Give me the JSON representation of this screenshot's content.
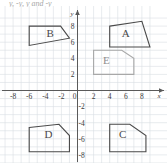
{
  "top_fragment": {
    "text": "y, -y,  y  and  -y"
  },
  "graph": {
    "colors": {
      "grid": "#d9dde3",
      "axis": "#5a5a5a",
      "shape_dark": "#4a4a4a",
      "shape_light": "#a8a8a8",
      "label_dark": "#4a4a4a",
      "label_light": "#8d8d8d",
      "background": "#ffffff"
    },
    "x_axis": {
      "name": "x",
      "min": -9,
      "max": 9,
      "tick_step": 2,
      "tick_labels": [
        "-8",
        "-6",
        "-4",
        "-2",
        "2",
        "4",
        "6",
        "8"
      ],
      "tick_values": [
        -8,
        -6,
        -4,
        -2,
        2,
        4,
        6,
        8
      ]
    },
    "y_axis": {
      "name": "y",
      "min": -8.5,
      "max": 9,
      "tick_step": 2,
      "tick_labels": [
        "8",
        "6",
        "4",
        "2",
        "-2",
        "-4",
        "-6",
        "-8"
      ],
      "tick_values": [
        8,
        6,
        4,
        2,
        -2,
        -4,
        -6,
        -8
      ]
    },
    "origin_label": "0",
    "grid_visible": true
  },
  "chart_data": {
    "type": "scatter",
    "title": "",
    "xlabel": "x",
    "ylabel": "y",
    "xlim": [
      -9,
      9
    ],
    "ylim": [
      -8.5,
      9
    ],
    "grid": true,
    "shapes": [
      {
        "label": "A",
        "color": "#4a4a4a",
        "label_x": 6.0,
        "label_y": 6.6,
        "vertices": [
          [
            4,
            8
          ],
          [
            8,
            8.6
          ],
          [
            9,
            5.4
          ],
          [
            4,
            5.4
          ]
        ]
      },
      {
        "label": "B",
        "color": "#4a4a4a",
        "label_x": -3.4,
        "label_y": 6.6,
        "vertices": [
          [
            -6,
            8
          ],
          [
            -2.1,
            8
          ],
          [
            -1,
            6.5
          ],
          [
            -6,
            5.6
          ]
        ]
      },
      {
        "label": "E",
        "color": "#a8a8a8",
        "label_x": 3.6,
        "label_y": 3.3,
        "vertices": [
          [
            2,
            5
          ],
          [
            5.5,
            5
          ],
          [
            7,
            4
          ],
          [
            7,
            2
          ],
          [
            2,
            2
          ]
        ]
      },
      {
        "label": "C",
        "color": "#4a4a4a",
        "label_x": 5.6,
        "label_y": -5.9,
        "vertices": [
          [
            4,
            -4.2
          ],
          [
            6.5,
            -4.2
          ],
          [
            8.5,
            -5.6
          ],
          [
            8.5,
            -7.6
          ],
          [
            4,
            -7.6
          ]
        ]
      },
      {
        "label": "D",
        "color": "#4a4a4a",
        "label_x": -3.6,
        "label_y": -5.9,
        "vertices": [
          [
            -6,
            -4.6
          ],
          [
            -2.3,
            -4.2
          ],
          [
            -1,
            -5.6
          ],
          [
            -1,
            -7.6
          ],
          [
            -6,
            -7.6
          ]
        ]
      }
    ]
  }
}
